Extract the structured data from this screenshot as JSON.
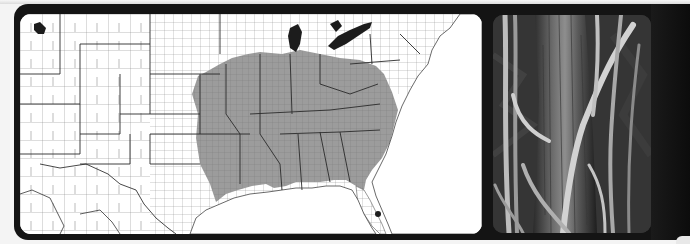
{
  "figure": {
    "map": {
      "description": "County-level map of the contiguous southeastern and central United States",
      "shaded_region": "eastern and southeastern United States (native range)",
      "colors": {
        "background": "#ffffff",
        "shaded_counties": "#9a9a9a",
        "county_lines": "#555555",
        "state_lines": "#222222",
        "water": "#1c1c1c"
      }
    },
    "photo": {
      "description": "Black and white photograph of woody vines climbing a tree trunk"
    },
    "frame_color": "#141414"
  }
}
